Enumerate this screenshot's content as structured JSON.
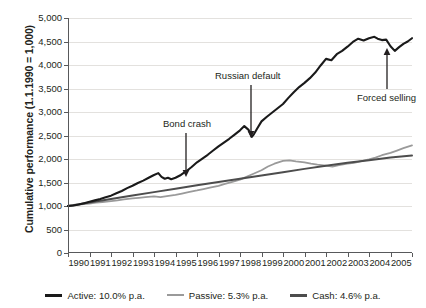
{
  "chart_data": {
    "type": "line",
    "title": "",
    "xlabel": "",
    "ylabel": "Cumulative performance (1.1.1990 = 1,000)",
    "xlim": [
      1990,
      2006
    ],
    "ylim": [
      0,
      5000
    ],
    "grid": true,
    "legend_position": "bottom",
    "y_ticks": [
      "0",
      "500",
      "1,000",
      "1,500",
      "2,000",
      "2,500",
      "3,000",
      "3,500",
      "4,000",
      "4,500",
      "5,000"
    ],
    "y_tick_values": [
      0,
      500,
      1000,
      1500,
      2000,
      2500,
      3000,
      3500,
      4000,
      4500,
      5000
    ],
    "categories": [
      "1990",
      "1991",
      "1992",
      "1993",
      "1994",
      "1995",
      "1996",
      "1997",
      "1998",
      "1999",
      "2000",
      "2001",
      "2002",
      "2003",
      "2004",
      "2005"
    ],
    "series": [
      {
        "name": "Active: 10.0% p.a.",
        "key": "active",
        "color": "#1a1a1a",
        "width": 2.1,
        "x": [
          1990.0,
          1990.25,
          1990.5,
          1990.75,
          1991.0,
          1991.25,
          1991.5,
          1991.75,
          1992.0,
          1992.25,
          1992.5,
          1992.75,
          1993.0,
          1993.25,
          1993.5,
          1993.75,
          1994.0,
          1994.2,
          1994.35,
          1994.5,
          1994.65,
          1994.8,
          1995.0,
          1995.25,
          1995.5,
          1995.75,
          1996.0,
          1996.25,
          1996.5,
          1996.75,
          1997.0,
          1997.25,
          1997.5,
          1997.75,
          1998.0,
          1998.2,
          1998.4,
          1998.55,
          1998.65,
          1998.8,
          1999.0,
          1999.25,
          1999.5,
          1999.75,
          2000.0,
          2000.25,
          2000.5,
          2000.75,
          2001.0,
          2001.25,
          2001.5,
          2001.75,
          2002.0,
          2002.25,
          2002.5,
          2002.75,
          2003.0,
          2003.25,
          2003.5,
          2003.75,
          2004.0,
          2004.25,
          2004.4,
          2004.6,
          2004.8,
          2005.0,
          2005.2,
          2005.4,
          2005.6,
          2005.8,
          2006.0
        ],
        "values": [
          1000,
          1010,
          1030,
          1060,
          1090,
          1120,
          1150,
          1185,
          1220,
          1270,
          1320,
          1380,
          1430,
          1490,
          1540,
          1600,
          1660,
          1700,
          1620,
          1580,
          1600,
          1570,
          1600,
          1660,
          1740,
          1830,
          1930,
          2010,
          2090,
          2180,
          2270,
          2350,
          2430,
          2520,
          2610,
          2700,
          2620,
          2470,
          2530,
          2650,
          2800,
          2900,
          2990,
          3080,
          3170,
          3300,
          3420,
          3530,
          3620,
          3720,
          3840,
          3990,
          4130,
          4100,
          4230,
          4300,
          4390,
          4490,
          4560,
          4520,
          4570,
          4600,
          4560,
          4530,
          4540,
          4400,
          4300,
          4380,
          4450,
          4500,
          4570
        ]
      },
      {
        "name": "Passive: 5.3% p.a.",
        "key": "passive",
        "color": "#9a9a9a",
        "width": 1.8,
        "x": [
          1990.0,
          1990.3,
          1990.6,
          1991.0,
          1991.3,
          1991.6,
          1992.0,
          1992.3,
          1992.6,
          1993.0,
          1993.3,
          1993.6,
          1994.0,
          1994.3,
          1994.6,
          1995.0,
          1995.3,
          1995.6,
          1996.0,
          1996.3,
          1996.6,
          1997.0,
          1997.3,
          1997.6,
          1998.0,
          1998.3,
          1998.6,
          1999.0,
          1999.3,
          1999.6,
          2000.0,
          2000.3,
          2000.6,
          2001.0,
          2001.3,
          2001.6,
          2002.0,
          2002.3,
          2002.6,
          2003.0,
          2003.3,
          2003.6,
          2004.0,
          2004.3,
          2004.6,
          2005.0,
          2005.3,
          2005.6,
          2006.0
        ],
        "values": [
          1000,
          1015,
          1035,
          1050,
          1070,
          1085,
          1105,
          1120,
          1140,
          1160,
          1175,
          1190,
          1205,
          1190,
          1210,
          1235,
          1265,
          1295,
          1330,
          1360,
          1390,
          1430,
          1470,
          1510,
          1560,
          1620,
          1680,
          1760,
          1840,
          1900,
          1960,
          1970,
          1950,
          1930,
          1900,
          1880,
          1860,
          1840,
          1870,
          1900,
          1920,
          1950,
          1990,
          2030,
          2080,
          2130,
          2180,
          2230,
          2290
        ]
      },
      {
        "name": "Cash: 4.6% p.a.",
        "key": "cash",
        "color": "#4d4d4d",
        "width": 2.0,
        "x": [
          1990.0,
          1991.0,
          1992.0,
          1993.0,
          1994.0,
          1995.0,
          1996.0,
          1997.0,
          1998.0,
          1999.0,
          2000.0,
          2001.0,
          2002.0,
          2003.0,
          2004.0,
          2005.0,
          2006.0
        ],
        "values": [
          1000,
          1075,
          1150,
          1225,
          1295,
          1365,
          1440,
          1510,
          1580,
          1650,
          1720,
          1790,
          1855,
          1920,
          1975,
          2030,
          2075
        ]
      }
    ],
    "annotations": [
      {
        "name": "bond-crash",
        "text": "Bond crash",
        "label_x": 163,
        "label_y": 118,
        "arrow_x": 186,
        "arrow_y1": 133,
        "arrow_y2": 177,
        "direction": "down"
      },
      {
        "name": "russian-default",
        "text": "Russian default",
        "label_x": 215,
        "label_y": 70,
        "arrow_x": 251,
        "arrow_y1": 85,
        "arrow_y2": 138,
        "direction": "down"
      },
      {
        "name": "forced-selling",
        "text": "Forced selling",
        "label_x": 357,
        "label_y": 92,
        "arrow_x": 387,
        "arrow_y1": 89,
        "arrow_y2": 48,
        "direction": "up"
      }
    ]
  }
}
